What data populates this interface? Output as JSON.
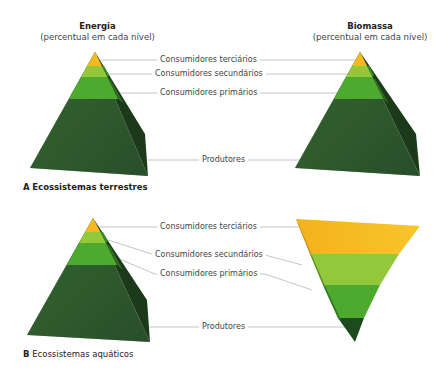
{
  "headings": {
    "energy": {
      "title": "Energia",
      "subtitle": "(percentual em cada nível)"
    },
    "biomass": {
      "title": "Biomassa",
      "subtitle": "(percentual em cada nível)"
    }
  },
  "section_a": {
    "letter": "A",
    "caption": "Ecossistemas terrestres",
    "labels": {
      "tertiary": "Consumidores terciários",
      "secondary": "Consumidores secundários",
      "primary": "Consumidores primários",
      "producers": "Produtores"
    }
  },
  "section_b": {
    "letter": "B",
    "caption": "Ecossistemas aquáticos",
    "labels": {
      "tertiary": "Consumidores terciários",
      "secondary": "Consumidores secundários",
      "primary": "Consumidores primários",
      "producers": "Produtores"
    }
  },
  "colors": {
    "tertiary": "#f5b81f",
    "secondary": "#93c83a",
    "primary": "#4ea92f",
    "producers": "#2f5a2c",
    "producers_shadow": "#1c3a1a",
    "leader_line": "#b5b5b5"
  }
}
